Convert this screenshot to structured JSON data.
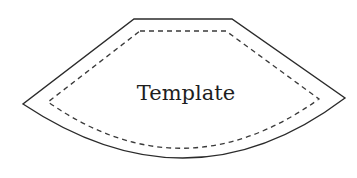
{
  "diagram": {
    "type": "pattern-template",
    "label": "Template",
    "outline": {
      "style": "solid",
      "color": "#2b2b2b"
    },
    "seam_line": {
      "style": "dashed",
      "color": "#3a3a3a"
    }
  }
}
